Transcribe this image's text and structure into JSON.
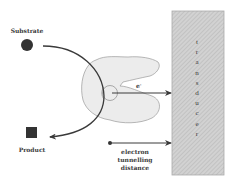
{
  "diagram": {
    "substrate_label": "Substrate",
    "product_label": "Product",
    "electron_label": "e",
    "electron_superscript": "-",
    "tunnelling_label": [
      "electron",
      "tunnelling",
      "distance"
    ],
    "transducer_letters": [
      "t",
      "r",
      "a",
      "n",
      "s",
      "d",
      "u",
      "c",
      "e",
      "r"
    ],
    "colors": {
      "stroke": "#3a3a3a",
      "enzyme_fill": "#ececec",
      "enzyme_stroke": "#9a9a9a",
      "transducer_fill": "#cfcfcf",
      "hatch": "#b5b5b5",
      "marker": "#333333"
    }
  }
}
